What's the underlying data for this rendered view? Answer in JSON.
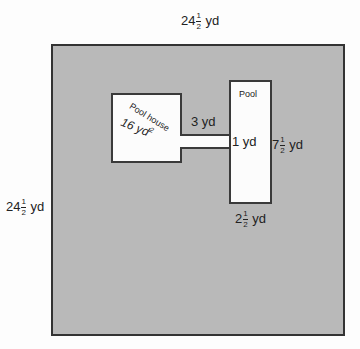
{
  "diagram": {
    "type": "floor-plan",
    "yard": {
      "top_dimension": {
        "whole": "24",
        "num": "1",
        "den": "2",
        "unit": "yd"
      },
      "left_dimension": {
        "whole": "24",
        "num": "1",
        "den": "2",
        "unit": "yd"
      }
    },
    "pool_house": {
      "label": "Pool house",
      "area_value": "16 yd",
      "area_exp": "2"
    },
    "walkway": {
      "length_label": "3 yd",
      "width_label": "1 yd"
    },
    "pool": {
      "label": "Pool",
      "height_dimension": {
        "whole": "7",
        "num": "1",
        "den": "2",
        "unit": "yd"
      },
      "width_dimension": {
        "whole": "2",
        "num": "1",
        "den": "2",
        "unit": "yd"
      }
    },
    "colors": {
      "yard_fill": "#b9b9b9",
      "structure_fill": "#fcfcfc",
      "outline": "#333333"
    }
  }
}
